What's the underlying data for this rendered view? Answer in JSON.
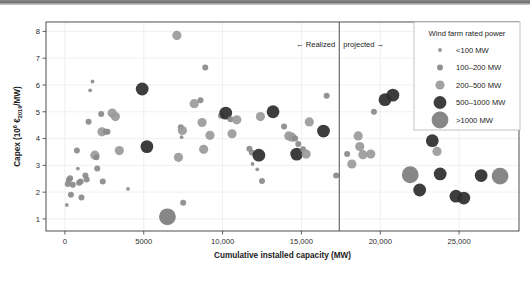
{
  "chart_data": {
    "type": "scatter",
    "title": "",
    "xlabel": "Cumulative installed capacity (MW)",
    "ylabel": "Capex (10^6 EUR_2019/MW)",
    "ylabel_parts": {
      "prefix": "Capex (10",
      "sup": "6",
      "mid": "€",
      "sub": "2019",
      "suffix": "/MW)"
    },
    "xlim": [
      -1200,
      28800
    ],
    "ylim": [
      0.55,
      8.35
    ],
    "grid": true,
    "x_ticks": [
      0,
      5000,
      10000,
      15000,
      20000,
      25000
    ],
    "x_tick_labels": [
      "0",
      "5000",
      "10,000",
      "15,000",
      "20,000",
      "25,000"
    ],
    "y_ticks": [
      1,
      2,
      3,
      4,
      5,
      6,
      7,
      8
    ],
    "y_tick_labels": [
      "1",
      "2",
      "3",
      "4",
      "5",
      "6",
      "7",
      "8"
    ],
    "divider": {
      "x": 17400,
      "label_left": "← Realized",
      "label_right": "projected →",
      "color": "#4d4d4d"
    },
    "legend": {
      "title": "Wind farm rated power",
      "position": "top-right",
      "entries": [
        {
          "label": "<100 MW",
          "radius": 1.9,
          "color": "#8e8e8e"
        },
        {
          "label": "100–200 MW",
          "radius": 3.0,
          "color": "#8a8a8a"
        },
        {
          "label": "200–500 MW",
          "radius": 4.6,
          "color": "#9a9a9a"
        },
        {
          "label": "500–1000 MW",
          "radius": 6.4,
          "color": "#2d2d2d"
        },
        {
          "label": ">1000 MW",
          "radius": 8.4,
          "color": "#7d7d7d"
        }
      ]
    },
    "size_classes": [
      {
        "name": "<100 MW",
        "radius": 1.9,
        "color": "#8e8e8e"
      },
      {
        "name": "100-200 MW",
        "radius": 3.0,
        "color": "#8a8a8a"
      },
      {
        "name": "200-500 MW",
        "radius": 4.6,
        "color": "#9a9a9a"
      },
      {
        "name": "500-1000 MW",
        "radius": 6.4,
        "color": "#2d2d2d"
      },
      {
        "name": ">1000 MW",
        "radius": 8.4,
        "color": "#7d7d7d"
      }
    ],
    "points": [
      {
        "x": 120,
        "y": 1.52,
        "cls": 0
      },
      {
        "x": 180,
        "y": 2.3,
        "cls": 1
      },
      {
        "x": 250,
        "y": 2.45,
        "cls": 1
      },
      {
        "x": 330,
        "y": 2.52,
        "cls": 1
      },
      {
        "x": 380,
        "y": 1.9,
        "cls": 1
      },
      {
        "x": 500,
        "y": 2.28,
        "cls": 1
      },
      {
        "x": 760,
        "y": 3.55,
        "cls": 1
      },
      {
        "x": 820,
        "y": 2.88,
        "cls": 0
      },
      {
        "x": 900,
        "y": 2.35,
        "cls": 1
      },
      {
        "x": 1000,
        "y": 2.4,
        "cls": 1
      },
      {
        "x": 1050,
        "y": 1.8,
        "cls": 1
      },
      {
        "x": 1300,
        "y": 2.62,
        "cls": 1
      },
      {
        "x": 1380,
        "y": 2.47,
        "cls": 1
      },
      {
        "x": 1500,
        "y": 4.63,
        "cls": 1
      },
      {
        "x": 1600,
        "y": 5.8,
        "cls": 0
      },
      {
        "x": 1750,
        "y": 6.13,
        "cls": 0
      },
      {
        "x": 1900,
        "y": 3.38,
        "cls": 2
      },
      {
        "x": 2000,
        "y": 3.3,
        "cls": 1
      },
      {
        "x": 2050,
        "y": 2.88,
        "cls": 1
      },
      {
        "x": 2300,
        "y": 4.92,
        "cls": 1
      },
      {
        "x": 2350,
        "y": 4.25,
        "cls": 2
      },
      {
        "x": 2600,
        "y": 4.25,
        "cls": 1
      },
      {
        "x": 2400,
        "y": 2.4,
        "cls": 1
      },
      {
        "x": 2700,
        "y": 4.25,
        "cls": 1
      },
      {
        "x": 3000,
        "y": 4.95,
        "cls": 2
      },
      {
        "x": 3200,
        "y": 4.82,
        "cls": 2
      },
      {
        "x": 3450,
        "y": 3.55,
        "cls": 2
      },
      {
        "x": 4000,
        "y": 2.12,
        "cls": 0
      },
      {
        "x": 4900,
        "y": 5.85,
        "cls": 3
      },
      {
        "x": 5200,
        "y": 3.7,
        "cls": 3
      },
      {
        "x": 6500,
        "y": 1.08,
        "cls": 4
      },
      {
        "x": 7100,
        "y": 7.85,
        "cls": 2
      },
      {
        "x": 7200,
        "y": 3.3,
        "cls": 2
      },
      {
        "x": 7350,
        "y": 4.42,
        "cls": 1
      },
      {
        "x": 7450,
        "y": 4.3,
        "cls": 2
      },
      {
        "x": 7400,
        "y": 4.05,
        "cls": 0
      },
      {
        "x": 7500,
        "y": 1.6,
        "cls": 1
      },
      {
        "x": 8200,
        "y": 5.3,
        "cls": 2
      },
      {
        "x": 8600,
        "y": 5.43,
        "cls": 1
      },
      {
        "x": 8700,
        "y": 4.6,
        "cls": 2
      },
      {
        "x": 8900,
        "y": 6.65,
        "cls": 1
      },
      {
        "x": 8800,
        "y": 3.6,
        "cls": 2
      },
      {
        "x": 9200,
        "y": 4.12,
        "cls": 2
      },
      {
        "x": 9900,
        "y": 4.85,
        "cls": 1
      },
      {
        "x": 10200,
        "y": 4.95,
        "cls": 3
      },
      {
        "x": 10500,
        "y": 4.72,
        "cls": 1
      },
      {
        "x": 10600,
        "y": 4.18,
        "cls": 2
      },
      {
        "x": 10900,
        "y": 4.7,
        "cls": 2
      },
      {
        "x": 11700,
        "y": 3.62,
        "cls": 1
      },
      {
        "x": 11850,
        "y": 3.48,
        "cls": 1
      },
      {
        "x": 11900,
        "y": 3.05,
        "cls": 0
      },
      {
        "x": 12200,
        "y": 2.85,
        "cls": 0
      },
      {
        "x": 12300,
        "y": 3.38,
        "cls": 3
      },
      {
        "x": 12400,
        "y": 4.82,
        "cls": 2
      },
      {
        "x": 12500,
        "y": 2.42,
        "cls": 1
      },
      {
        "x": 13200,
        "y": 5.0,
        "cls": 3
      },
      {
        "x": 13900,
        "y": 4.45,
        "cls": 1
      },
      {
        "x": 14200,
        "y": 4.1,
        "cls": 2
      },
      {
        "x": 14400,
        "y": 4.05,
        "cls": 2
      },
      {
        "x": 14600,
        "y": 4.0,
        "cls": 1
      },
      {
        "x": 14800,
        "y": 3.8,
        "cls": 1
      },
      {
        "x": 14700,
        "y": 3.42,
        "cls": 3
      },
      {
        "x": 15100,
        "y": 3.6,
        "cls": 1
      },
      {
        "x": 15300,
        "y": 3.42,
        "cls": 2
      },
      {
        "x": 15500,
        "y": 4.62,
        "cls": 2
      },
      {
        "x": 16400,
        "y": 4.28,
        "cls": 3
      },
      {
        "x": 16600,
        "y": 5.6,
        "cls": 1
      },
      {
        "x": 17200,
        "y": 2.62,
        "cls": 1
      },
      {
        "x": 17900,
        "y": 3.42,
        "cls": 1
      },
      {
        "x": 18200,
        "y": 3.05,
        "cls": 2
      },
      {
        "x": 18600,
        "y": 4.1,
        "cls": 2
      },
      {
        "x": 18700,
        "y": 3.7,
        "cls": 2
      },
      {
        "x": 18900,
        "y": 3.4,
        "cls": 2
      },
      {
        "x": 19400,
        "y": 3.42,
        "cls": 2
      },
      {
        "x": 19600,
        "y": 5.0,
        "cls": 1
      },
      {
        "x": 20300,
        "y": 5.45,
        "cls": 3
      },
      {
        "x": 20800,
        "y": 5.62,
        "cls": 3
      },
      {
        "x": 21900,
        "y": 2.65,
        "cls": 4
      },
      {
        "x": 22500,
        "y": 2.08,
        "cls": 3
      },
      {
        "x": 23300,
        "y": 3.92,
        "cls": 3
      },
      {
        "x": 23600,
        "y": 3.52,
        "cls": 2
      },
      {
        "x": 23800,
        "y": 2.68,
        "cls": 3
      },
      {
        "x": 24800,
        "y": 1.85,
        "cls": 3
      },
      {
        "x": 25300,
        "y": 1.78,
        "cls": 3
      },
      {
        "x": 26400,
        "y": 2.62,
        "cls": 3
      },
      {
        "x": 27600,
        "y": 2.6,
        "cls": 4
      }
    ]
  }
}
